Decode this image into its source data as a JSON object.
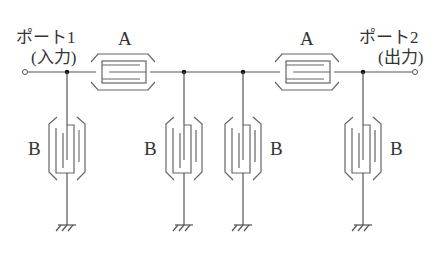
{
  "diagram": {
    "type": "ladder-type SAW/resonator filter schematic",
    "ports": [
      {
        "id": "port1",
        "label": "ポート1",
        "sublabel": "(入力)"
      },
      {
        "id": "port2",
        "label": "ポート2",
        "sublabel": "(出力)"
      }
    ],
    "series_resonators": [
      {
        "id": "A1",
        "label": "A"
      },
      {
        "id": "A2",
        "label": "A"
      }
    ],
    "shunt_resonators": [
      {
        "id": "B1",
        "label": "B"
      },
      {
        "id": "B2",
        "label": "B"
      },
      {
        "id": "B3",
        "label": "B"
      },
      {
        "id": "B4",
        "label": "B"
      }
    ],
    "line_color": "#555555",
    "symbol_color": "#666666",
    "text_color": "#333333"
  }
}
